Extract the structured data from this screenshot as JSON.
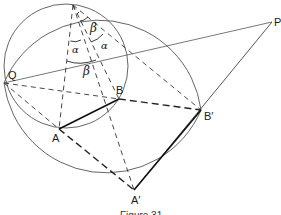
{
  "figure": {
    "caption": "Figure 31",
    "colors": {
      "stroke": "#222222",
      "circle": "#555555",
      "background": "#ffffff"
    },
    "points": {
      "T": {
        "label": "",
        "x": 73,
        "y": 5
      },
      "P": {
        "label": "P",
        "x": 272,
        "y": 22
      },
      "Q": {
        "label": "Q",
        "x": 4,
        "y": 83
      },
      "B": {
        "label": "B",
        "x": 119,
        "y": 99
      },
      "B_prime": {
        "label": "B′",
        "x": 201,
        "y": 110
      },
      "A": {
        "label": "A",
        "x": 59,
        "y": 129
      },
      "A_prime": {
        "label": "A′",
        "x": 134,
        "y": 190
      }
    },
    "angle_labels": {
      "alpha_left": "α",
      "alpha_right": "α",
      "beta_top": "β",
      "beta_bottom": "β"
    },
    "circles": [
      {
        "name": "small-circle",
        "cx": 66,
        "cy": 66,
        "r": 62
      },
      {
        "name": "large-circle",
        "cx": 110,
        "cy": 93,
        "r": 97
      }
    ]
  }
}
